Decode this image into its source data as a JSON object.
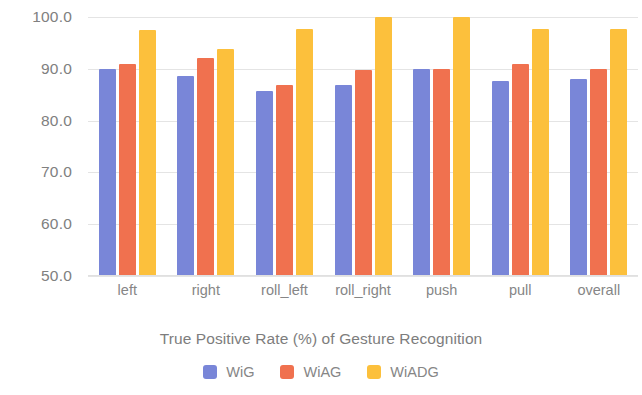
{
  "chart_data": {
    "type": "bar",
    "title": "",
    "xlabel": "True Positive Rate (%) of Gesture Recognition",
    "ylabel": "",
    "ylim": [
      50.0,
      100.0
    ],
    "yticks": [
      "50.0",
      "60.0",
      "70.0",
      "80.0",
      "90.0",
      "100.0"
    ],
    "ytick_values": [
      50.0,
      60.0,
      70.0,
      80.0,
      90.0,
      100.0
    ],
    "grid": true,
    "legend_position": "bottom",
    "categories": [
      "left",
      "right",
      "roll_left",
      "roll_right",
      "push",
      "pull",
      "overall"
    ],
    "series": [
      {
        "name": "WiG",
        "color": "#7986d8",
        "values": [
          90.0,
          88.7,
          85.8,
          86.9,
          90.0,
          87.6,
          88.1
        ]
      },
      {
        "name": "WiAG",
        "color": "#f0714f",
        "values": [
          90.9,
          92.0,
          86.8,
          89.8,
          90.0,
          91.0,
          90.0
        ]
      },
      {
        "name": "WiADG",
        "color": "#fcc03c",
        "values": [
          97.5,
          93.8,
          97.6,
          100.0,
          100.0,
          97.7,
          97.6
        ]
      }
    ]
  },
  "legend": {
    "items": [
      {
        "label": "WiG"
      },
      {
        "label": "WiAG"
      },
      {
        "label": "WiADG"
      }
    ]
  }
}
